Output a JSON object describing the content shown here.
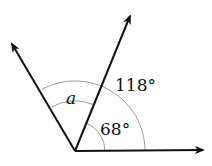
{
  "diagram": {
    "type": "angle-diagram",
    "vertex": {
      "x": 75,
      "y": 151
    },
    "rays": [
      {
        "name": "horizontal-ray",
        "tip": {
          "x": 203,
          "y": 150
        }
      },
      {
        "name": "middle-ray",
        "tip": {
          "x": 130,
          "y": 16
        }
      },
      {
        "name": "left-ray",
        "tip": {
          "x": 12,
          "y": 44
        }
      }
    ],
    "arcs": [
      {
        "name": "outer-arc",
        "radius": 70,
        "measure": "118°"
      },
      {
        "name": "inner-arc",
        "radius": 30,
        "measure": "68°"
      }
    ],
    "labels": {
      "outer_angle": "118°",
      "inner_angle": "68°",
      "unknown_angle": "a"
    },
    "colors": {
      "ray": "#111111",
      "arc": "#9a9a9a",
      "text": "#111111"
    }
  }
}
